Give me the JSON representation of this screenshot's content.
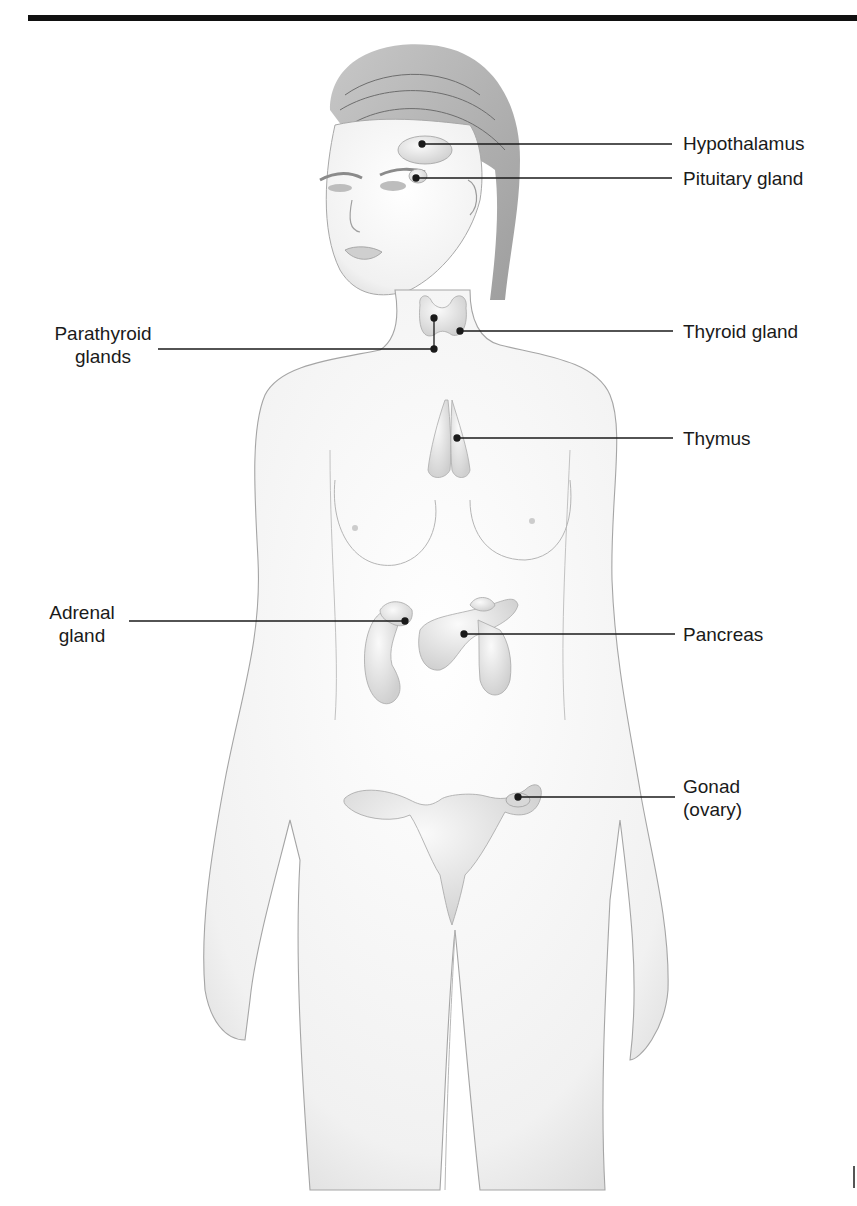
{
  "diagram": {
    "colors": {
      "rule": "#111111",
      "leader_line": "#1a1a1a",
      "skin_outline": "#9a9a9a",
      "gland_fill": "#e6e6e6",
      "hair": "#8a8a8a"
    },
    "labels": {
      "hypothalamus": "Hypothalamus",
      "pituitary": "Pituitary gland",
      "parathyroid_line1": "Parathyroid",
      "parathyroid_line2": "glands",
      "thyroid": "Thyroid gland",
      "thymus": "Thymus",
      "adrenal_line1": "Adrenal",
      "adrenal_line2": "gland",
      "pancreas": "Pancreas",
      "gonad_line1": "Gonad",
      "gonad_line2": "(ovary)"
    }
  }
}
